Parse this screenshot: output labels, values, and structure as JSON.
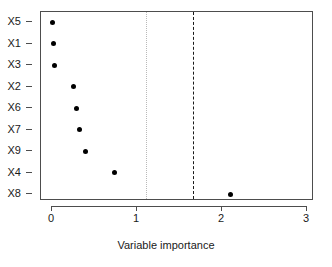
{
  "chart_data": {
    "type": "scatter",
    "title": "",
    "xlabel": "Variable importance",
    "ylabel": "",
    "xlim": [
      -0.13,
      3.08
    ],
    "ylim_categories": [
      "X5",
      "X1",
      "X3",
      "X2",
      "X6",
      "X7",
      "X9",
      "X4",
      "X8"
    ],
    "categories": [
      "X5",
      "X1",
      "X3",
      "X2",
      "X6",
      "X7",
      "X9",
      "X4",
      "X8"
    ],
    "values": [
      0.01,
      0.02,
      0.03,
      0.25,
      0.29,
      0.32,
      0.39,
      0.73,
      2.1
    ],
    "points": [
      {
        "label": "X5",
        "value": 0.01
      },
      {
        "label": "X1",
        "value": 0.02
      },
      {
        "label": "X3",
        "value": 0.03
      },
      {
        "label": "X2",
        "value": 0.25
      },
      {
        "label": "X6",
        "value": 0.29
      },
      {
        "label": "X7",
        "value": 0.32
      },
      {
        "label": "X9",
        "value": 0.39
      },
      {
        "label": "X4",
        "value": 0.73
      },
      {
        "label": "X8",
        "value": 2.1
      }
    ],
    "x_ticks": [
      0,
      1,
      2,
      3
    ],
    "x_tick_labels": [
      "0",
      "1",
      "2",
      "3"
    ],
    "reference_lines": [
      {
        "name": "dotted-threshold",
        "value": 1.11,
        "style": "dotted",
        "color": "#b9b9b9"
      },
      {
        "name": "dashed-threshold",
        "value": 1.66,
        "style": "dashed",
        "color": "#1a1a1a"
      }
    ],
    "grid": false,
    "legend": null,
    "marker": "filled-circle",
    "marker_color": "#000000"
  }
}
